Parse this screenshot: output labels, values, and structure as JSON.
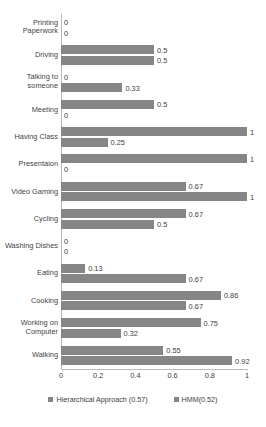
{
  "chart_data": {
    "type": "bar",
    "orientation": "horizontal",
    "title": "",
    "xlabel": "",
    "ylabel": "",
    "xlim": [
      0,
      1
    ],
    "xticks": [
      "0",
      "0.2",
      "0.4",
      "0.6",
      "0.8",
      "1"
    ],
    "grid": false,
    "legend_position": "bottom",
    "categories": [
      "Printing Paperwork",
      "Driving",
      "Talking to someone",
      "Meeting",
      "Having Class",
      "Presentaion",
      "Video Gaming",
      "Cycling",
      "Washing Dishes",
      "Eating",
      "Cooking",
      "Working on Computer",
      "Walking"
    ],
    "series": [
      {
        "name": "Hierarchical Approach (0.57)",
        "color": "#868686",
        "values": [
          0,
          0.5,
          0,
          0.5,
          1,
          1,
          0.67,
          0.67,
          0,
          0.13,
          0.86,
          0.75,
          0.55
        ],
        "labels": [
          "0",
          "0.5",
          "0",
          "0.5",
          "1",
          "1",
          "0.67",
          "0.67",
          "0",
          "0.13",
          "0.86",
          "0.75",
          "0.55"
        ]
      },
      {
        "name": "HMM(0.52)",
        "color": "#868686",
        "values": [
          0,
          0.5,
          0.33,
          0,
          0.25,
          0,
          1,
          0.5,
          0,
          0.67,
          0.67,
          0.32,
          0.92
        ],
        "labels": [
          "0",
          "0.5",
          "0.33",
          "0",
          "0.25",
          "0",
          "1",
          "0.5",
          "0",
          "0.67",
          "0.67",
          "0.32",
          "0.92"
        ]
      }
    ]
  },
  "legend": {
    "items": [
      {
        "label": "Hierarchical Approach (0.57)"
      },
      {
        "label": "HMM(0.52)"
      }
    ]
  }
}
